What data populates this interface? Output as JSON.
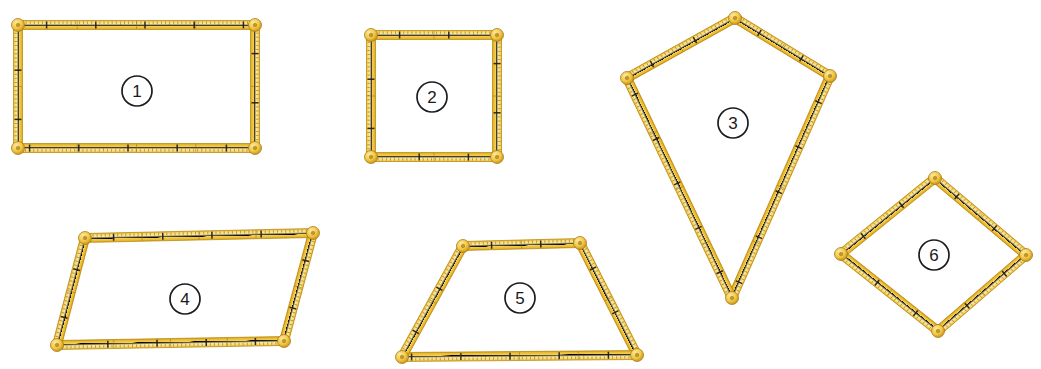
{
  "page": {
    "background_color": "#ffffff",
    "width": 1041,
    "height": 369
  },
  "style": {
    "ruler_fill_light": "#fbe08a",
    "ruler_fill_mid": "#f2c838",
    "ruler_fill_dark": "#d9a41c",
    "ruler_edge": "#b8860b",
    "tick_color": "#6b5310",
    "major_tick_color": "#231f20",
    "joint_fill": "#f3ca45",
    "joint_edge": "#a9791a",
    "label_circle_stroke": "#1c1c20",
    "label_text_color": "#1a1a1a",
    "ruler_thickness": 9
  },
  "shapes": [
    {
      "id": "shape-1",
      "label": "1",
      "name": "rectangle",
      "label_center": {
        "x": 137,
        "y": 91
      },
      "label_radius": 15,
      "vertices": [
        {
          "x": 18,
          "y": 25
        },
        {
          "x": 255,
          "y": 25
        },
        {
          "x": 255,
          "y": 148
        },
        {
          "x": 18,
          "y": 148
        }
      ]
    },
    {
      "id": "shape-2",
      "label": "2",
      "name": "square",
      "label_center": {
        "x": 432,
        "y": 97
      },
      "label_radius": 15,
      "vertices": [
        {
          "x": 371,
          "y": 35
        },
        {
          "x": 497,
          "y": 35
        },
        {
          "x": 497,
          "y": 157
        },
        {
          "x": 371,
          "y": 157
        }
      ]
    },
    {
      "id": "shape-3",
      "label": "3",
      "name": "kite",
      "label_center": {
        "x": 733,
        "y": 123
      },
      "label_radius": 15,
      "vertices": [
        {
          "x": 735,
          "y": 18
        },
        {
          "x": 830,
          "y": 76
        },
        {
          "x": 732,
          "y": 298
        },
        {
          "x": 627,
          "y": 78
        }
      ]
    },
    {
      "id": "shape-4",
      "label": "4",
      "name": "parallelogram",
      "label_center": {
        "x": 185,
        "y": 299
      },
      "label_radius": 15,
      "vertices": [
        {
          "x": 85,
          "y": 238
        },
        {
          "x": 313,
          "y": 233
        },
        {
          "x": 284,
          "y": 341
        },
        {
          "x": 57,
          "y": 345
        }
      ]
    },
    {
      "id": "shape-5",
      "label": "5",
      "name": "trapezoid",
      "label_center": {
        "x": 520,
        "y": 298
      },
      "label_radius": 15,
      "vertices": [
        {
          "x": 463,
          "y": 246
        },
        {
          "x": 580,
          "y": 243
        },
        {
          "x": 637,
          "y": 355
        },
        {
          "x": 402,
          "y": 357
        }
      ]
    },
    {
      "id": "shape-6",
      "label": "6",
      "name": "rhombus",
      "label_center": {
        "x": 934,
        "y": 255
      },
      "label_radius": 15,
      "vertices": [
        {
          "x": 935,
          "y": 178
        },
        {
          "x": 1026,
          "y": 255
        },
        {
          "x": 938,
          "y": 331
        },
        {
          "x": 841,
          "y": 254
        }
      ]
    }
  ]
}
